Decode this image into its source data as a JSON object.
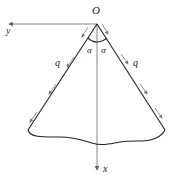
{
  "diagram": {
    "type": "wedge-with-edge-loads",
    "labels": {
      "origin": "O",
      "y_axis": "y",
      "x_axis": "x",
      "angle_left": "α",
      "angle_right": "α",
      "load_left": "q",
      "load_right": "q"
    },
    "colors": {
      "edge": "#222222",
      "axis": "#666666",
      "load_arrow": "#777777"
    }
  }
}
